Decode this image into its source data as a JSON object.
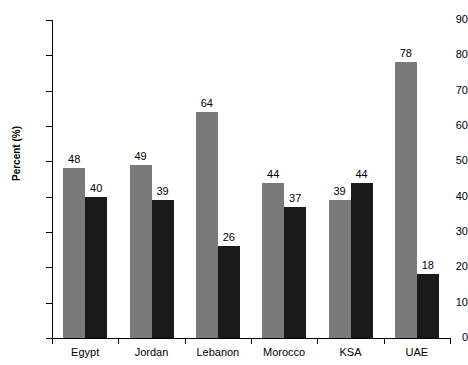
{
  "chart_data": {
    "type": "bar",
    "title": "",
    "subtitle": "",
    "xlabel": "",
    "ylabel": "Percent (%)",
    "ylim": [
      0,
      90
    ],
    "ytick_step": 10,
    "yticks": [
      0,
      10,
      20,
      30,
      40,
      50,
      60,
      70,
      80,
      90
    ],
    "grid": false,
    "legend": "none",
    "show_data_labels": true,
    "categories": [
      "Egypt",
      "Jordan",
      "Lebanon",
      "Morocco",
      "KSA",
      "UAE"
    ],
    "series": [
      {
        "name": "series-a",
        "color": "#7a7a7a",
        "values": [
          48,
          49,
          64,
          44,
          39,
          78
        ]
      },
      {
        "name": "series-b",
        "color": "#1a1a1a",
        "values": [
          40,
          39,
          26,
          37,
          44,
          18
        ]
      }
    ]
  },
  "axis": {
    "y_title": "Percent (%)",
    "y_tick_labels": [
      "0",
      "10",
      "20",
      "30",
      "40",
      "50",
      "60",
      "70",
      "80",
      "90"
    ],
    "x_tick_labels": [
      "Egypt",
      "Jordan",
      "Lebanon",
      "Morocco",
      "KSA",
      "UAE"
    ]
  },
  "colors": {
    "series_a": "#7a7a7a",
    "series_b": "#1a1a1a",
    "axis": "#000000",
    "background": "#ffffff",
    "text": "#000000"
  }
}
